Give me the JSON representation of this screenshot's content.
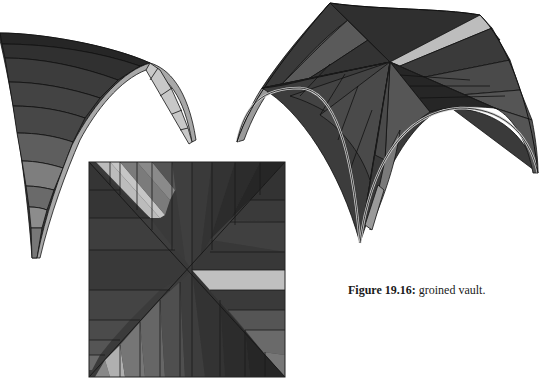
{
  "figure": {
    "caption_label": "Figure 19.16:",
    "caption_text": " groined vault.",
    "panels": [
      {
        "id": "half-arch",
        "description": "single diagonal rib arch section, perspective view"
      },
      {
        "id": "groined-vault-3d",
        "description": "full groined vault, perspective view with four feet"
      },
      {
        "id": "groined-vault-plan",
        "description": "plan view of groined vault, square with diagonal groins"
      }
    ],
    "colors": {
      "dark": "#2e2e2e",
      "mid_dark": "#3f3f3f",
      "mid": "#4d4d4d",
      "mid_light": "#666666",
      "light": "#8a8a8a",
      "lightest": "#bdbdbd",
      "edge": "#111111"
    }
  }
}
